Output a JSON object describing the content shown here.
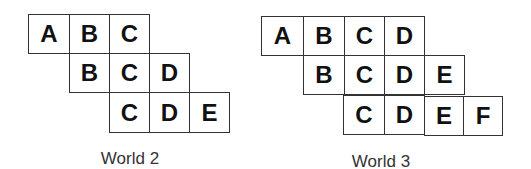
{
  "worlds": [
    {
      "caption": "World 2",
      "rows": [
        [
          "A",
          "B",
          "C"
        ],
        [
          "B",
          "C",
          "D"
        ],
        [
          "C",
          "D",
          "E"
        ]
      ]
    },
    {
      "caption": "World 3",
      "rows": [
        [
          "A",
          "B",
          "C",
          "D"
        ],
        [
          "B",
          "C",
          "D",
          "E"
        ],
        [
          "C",
          "D",
          "E",
          "F"
        ]
      ]
    }
  ]
}
